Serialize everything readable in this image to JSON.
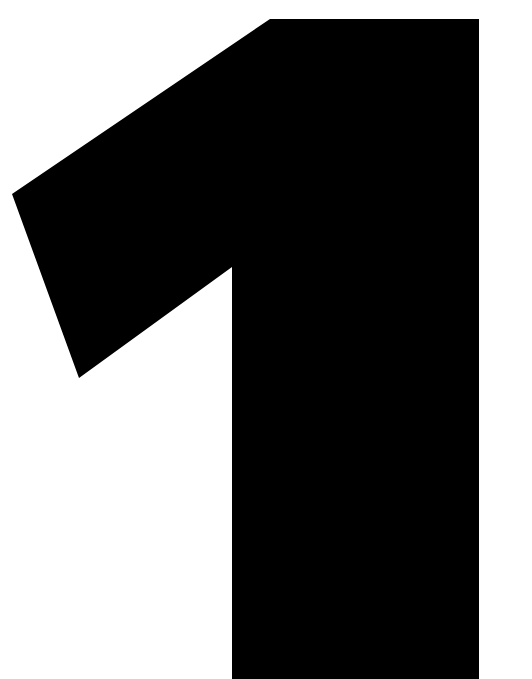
{
  "image": {
    "numeral": "1",
    "background_color": "#ffffff",
    "glyph_color": "#000000"
  }
}
